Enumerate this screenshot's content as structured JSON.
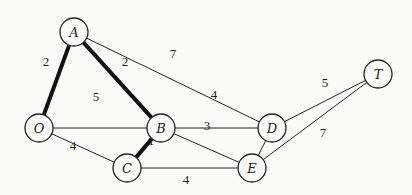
{
  "graph": {
    "nodes": [
      {
        "id": "A",
        "label": "A",
        "x": 74,
        "y": 32
      },
      {
        "id": "O",
        "label": "O",
        "x": 39,
        "y": 128
      },
      {
        "id": "B",
        "label": "B",
        "x": 161,
        "y": 128
      },
      {
        "id": "C",
        "label": "C",
        "x": 127,
        "y": 168
      },
      {
        "id": "D",
        "label": "D",
        "x": 272,
        "y": 128
      },
      {
        "id": "E",
        "label": "E",
        "x": 252,
        "y": 168
      },
      {
        "id": "T",
        "label": "T",
        "x": 378,
        "y": 74
      }
    ],
    "edges": [
      {
        "from": "O",
        "to": "A",
        "weight": "2",
        "bold": true,
        "lx": 46,
        "ly": 66
      },
      {
        "from": "A",
        "to": "B",
        "weight": "2",
        "bold": true,
        "lx": 125,
        "ly": 66
      },
      {
        "from": "A",
        "to": "D",
        "weight": "7",
        "bold": false,
        "lx": 173,
        "ly": 58
      },
      {
        "from": "O",
        "to": "B",
        "weight": "5",
        "bold": false,
        "lx": 96,
        "ly": 101
      },
      {
        "from": "O",
        "to": "C",
        "weight": "4",
        "bold": false,
        "lx": 73,
        "ly": 150
      },
      {
        "from": "B",
        "to": "C",
        "weight": "1",
        "bold": true,
        "lx": 151,
        "ly": 145
      },
      {
        "from": "B",
        "to": "D",
        "weight": "4",
        "bold": false,
        "lx": 214,
        "ly": 99
      },
      {
        "from": "B",
        "to": "E",
        "weight": "3",
        "bold": false,
        "lx": 207,
        "ly": 130
      },
      {
        "from": "C",
        "to": "E",
        "weight": "4",
        "bold": false,
        "lx": 186,
        "ly": 184
      },
      {
        "from": "D",
        "to": "E",
        "weight": "1",
        "bold": false,
        "lx": 272,
        "ly": 140
      },
      {
        "from": "D",
        "to": "T",
        "weight": "5",
        "bold": false,
        "lx": 325,
        "ly": 87
      },
      {
        "from": "E",
        "to": "T",
        "weight": "7",
        "bold": false,
        "lx": 323,
        "ly": 137
      }
    ]
  }
}
